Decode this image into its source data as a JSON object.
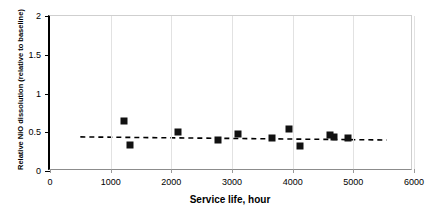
{
  "chart_data": {
    "type": "scatter",
    "title": "",
    "xlabel": "Service life, hour",
    "ylabel": "Relative NiO dissolution (relative to baseline)",
    "xlim": [
      0,
      6000
    ],
    "ylim": [
      0,
      2
    ],
    "xticks": [
      0,
      1000,
      2000,
      3000,
      4000,
      5000,
      6000
    ],
    "xtick_labels": [
      "0",
      "1000",
      "2000",
      "3000",
      "4000",
      "5000",
      "6000"
    ],
    "yticks": [
      0,
      0.5,
      1,
      1.5,
      2
    ],
    "ytick_labels": [
      "0",
      "0.5",
      "1",
      "1.5",
      "2"
    ],
    "grid": "vertical-faint",
    "legend": null,
    "marker_color": "#111111",
    "marker_shape": "square",
    "series": [
      {
        "name": "Relative NiO dissolution",
        "points": [
          {
            "x": 1220,
            "y": 0.64
          },
          {
            "x": 1320,
            "y": 0.33
          },
          {
            "x": 2110,
            "y": 0.5
          },
          {
            "x": 2770,
            "y": 0.4
          },
          {
            "x": 3100,
            "y": 0.48
          },
          {
            "x": 3660,
            "y": 0.43
          },
          {
            "x": 3940,
            "y": 0.54
          },
          {
            "x": 4120,
            "y": 0.32
          },
          {
            "x": 4610,
            "y": 0.46
          },
          {
            "x": 4680,
            "y": 0.44
          },
          {
            "x": 4910,
            "y": 0.43
          }
        ]
      }
    ],
    "trendline": {
      "style": "dashed",
      "color": "#000000",
      "x_start": 500,
      "y_start": 0.44,
      "x_end": 5550,
      "y_end": 0.4
    }
  }
}
